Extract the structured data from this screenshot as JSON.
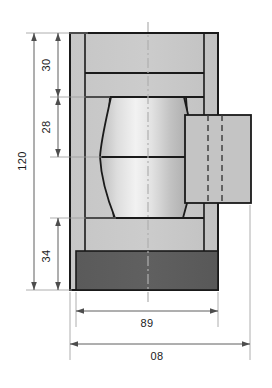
{
  "drawing": {
    "type": "engineering-section-view",
    "title": "",
    "canvas": {
      "width": 272,
      "height": 388,
      "background": "#ffffff"
    },
    "colors": {
      "outline": "#1a1a1a",
      "body_fill": "#c9c9c9",
      "body_fill_light": "#cfcfcf",
      "dark_block_fill": "#5c5c5c",
      "spool_light": "#eeeeee",
      "spool_mid": "#d2d2d2",
      "spool_dark": "#a8a8a8",
      "side_block_fill": "#c4c4c4",
      "dimension_line": "#4d4d4d",
      "centerline": "#b3b3b3",
      "extension_line": "#8c8c8c"
    },
    "vertical_dimensions": [
      {
        "name": "overall-height",
        "label": "120",
        "orientation": "vertical",
        "from_y": 33,
        "to_y": 290,
        "line_x": 34
      },
      {
        "name": "top-section",
        "label": "30",
        "orientation": "vertical",
        "from_y": 33,
        "to_y": 97,
        "line_x": 58
      },
      {
        "name": "middle-section",
        "label": "28",
        "orientation": "vertical",
        "from_y": 97,
        "to_y": 157,
        "line_x": 58
      },
      {
        "name": "bottom-section",
        "label": "34",
        "orientation": "vertical",
        "from_y": 218,
        "to_y": 290,
        "line_x": 58
      }
    ],
    "horizontal_dimensions": [
      {
        "name": "inner-width",
        "label": "89",
        "orientation": "horizontal",
        "from_x": 76,
        "to_x": 218,
        "line_y": 321
      },
      {
        "name": "overall-width",
        "label": "08",
        "orientation": "horizontal",
        "from_x": 70,
        "to_x": 250,
        "line_y": 354
      }
    ],
    "features": [
      {
        "name": "outer-frame",
        "shape": "rect",
        "fill": "body_fill"
      },
      {
        "name": "top-band",
        "shape": "rect",
        "fill": "body_fill"
      },
      {
        "name": "second-band",
        "shape": "rect",
        "fill": "body_fill"
      },
      {
        "name": "spool-body",
        "shape": "hourglass",
        "fill": "gradient"
      },
      {
        "name": "lower-band",
        "shape": "rect",
        "fill": "body_fill"
      },
      {
        "name": "dark-base-block",
        "shape": "rect",
        "fill": "dark_block_fill"
      },
      {
        "name": "right-side-block",
        "shape": "rect",
        "fill": "side_block_fill"
      },
      {
        "name": "hidden-line-left",
        "shape": "dashed-line"
      },
      {
        "name": "hidden-line-right",
        "shape": "dashed-line"
      },
      {
        "name": "vertical-centerline",
        "shape": "dash-dot-line"
      }
    ]
  }
}
